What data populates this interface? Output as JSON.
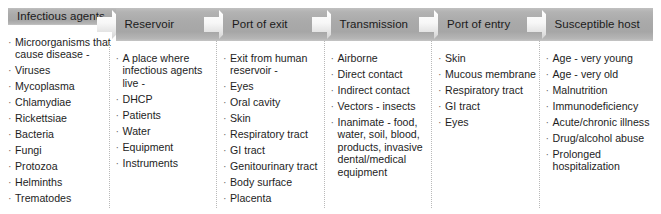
{
  "diagram": {
    "type": "flowchart",
    "connector_icon": "right-arrow-icon",
    "colors": {
      "header_gray": "#a9a9a9",
      "header_gray_light": "#c4c4c4",
      "arrow_white": "#ffffff",
      "divider": "#b9b9b9",
      "text": "#1d1d1d",
      "background": "#ffffff"
    },
    "stages": [
      {
        "id": "infectious-agents",
        "header": "Infectious agents",
        "items": [
          "Microorganisms that cause disease -",
          "Viruses",
          "Mycoplasma",
          "Chlamydiae",
          "Rickettsiae",
          "Bacteria",
          "Fungi",
          "Protozoa",
          "Helminths",
          "Trematodes"
        ]
      },
      {
        "id": "reservoir",
        "header": "Reservoir",
        "items": [
          "A place where infectious agents live -",
          "DHCP",
          "Patients",
          "Water",
          "Equipment",
          "Instruments"
        ]
      },
      {
        "id": "port-of-exit",
        "header": "Port of exit",
        "items": [
          "Exit from human reservoir -",
          "Eyes",
          "Oral cavity",
          "Skin",
          "Respiratory tract",
          "GI tract",
          "Genitourinary tract",
          "Body surface",
          "Placenta"
        ]
      },
      {
        "id": "transmission",
        "header": "Transmission",
        "items": [
          "Airborne",
          "Direct contact",
          "Indirect contact",
          "Vectors - insects",
          "Inanimate - food, water, soil, blood, products, invasive dental/medical equipment"
        ]
      },
      {
        "id": "port-of-entry",
        "header": "Port of entry",
        "items": [
          "Skin",
          "Mucous membrane",
          "Respiratory tract",
          "GI tract",
          "Eyes"
        ]
      },
      {
        "id": "susceptible-host",
        "header": "Susceptible host",
        "items": [
          "Age - very young",
          "Age - very old",
          "Malnutrition",
          "Immunodeficiency",
          "Acute/chronic illness",
          "Drug/alcohol abuse",
          "Prolonged hospitalization"
        ]
      }
    ]
  }
}
